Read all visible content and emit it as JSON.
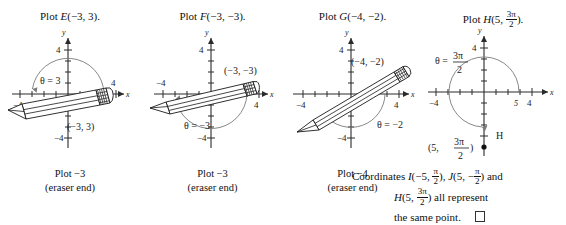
{
  "figure": {
    "panels": [
      {
        "id": "plot-e",
        "title_prefix": "Plot ",
        "title_letter": "E",
        "title_args": "(−3, 3).",
        "theta_label": "θ = 3",
        "point_label": "(−3, 3)",
        "caption_line1": "Plot −3",
        "caption_line2": "(eraser end)",
        "x_tick_labels": [
          "−4",
          "4"
        ],
        "y_tick_labels": [
          "4",
          "−4"
        ],
        "x_axis_name": "x",
        "y_axis_name": "y",
        "r": -3,
        "theta": 3
      },
      {
        "id": "plot-f",
        "title_prefix": "Plot ",
        "title_letter": "F",
        "title_args": "(−3, −3).",
        "theta_label": "θ = −3",
        "point_label": "(−3, −3)",
        "caption_line1": "Plot −3",
        "caption_line2": "(eraser end)",
        "x_tick_labels": [
          "−4",
          "4"
        ],
        "y_tick_labels": [
          "4",
          "−4"
        ],
        "x_axis_name": "x",
        "y_axis_name": "y",
        "r": -3,
        "theta": -3
      },
      {
        "id": "plot-g",
        "title_prefix": "Plot ",
        "title_letter": "G",
        "title_args": "(−4, −2).",
        "theta_label": "θ = −2",
        "point_label": "(−4, −2)",
        "caption_line1": "Plot −4",
        "caption_line2": "(eraser end)",
        "x_tick_labels": [
          "−4",
          "4"
        ],
        "y_tick_labels": [
          "4",
          "−4"
        ],
        "x_axis_name": "x",
        "y_axis_name": "y",
        "r": -4,
        "theta": -2
      },
      {
        "id": "plot-h",
        "title_prefix": "Plot ",
        "title_letter": "H",
        "title_args_pre": "(5, ",
        "title_frac_num": "3π",
        "title_frac_den": "2",
        "title_args_post": ").",
        "theta_eq": "θ = ",
        "theta_frac_num": "3π",
        "theta_frac_den": "2",
        "point_pre": "(5, ",
        "point_frac_num": "3π",
        "point_frac_den": "2",
        "point_post": ")",
        "point_letter": "H",
        "x_tick_labels": [
          "−4",
          "4"
        ],
        "y_tick_labels": [
          "4"
        ],
        "x_tick_italic": "5",
        "x_axis_name": "x",
        "y_axis_name": "y",
        "r": 5,
        "theta": 4.712388
      }
    ],
    "note": {
      "line1_pre": "Coordinates ",
      "line1_i": "I",
      "line1_i_args_pre": "(−5, ",
      "line1_i_frac_num": "π",
      "line1_i_frac_den": "2",
      "line1_i_args_post": "), ",
      "line1_j": "J",
      "line1_j_args_pre": "(5, −",
      "line1_j_frac_num": "π",
      "line1_j_frac_den": "2",
      "line1_j_args_post": ") and",
      "line2_h": "H",
      "line2_pre": "(5, ",
      "line2_frac_num": "3π",
      "line2_frac_den": "2",
      "line2_post": ") all represent",
      "line3": "the same point."
    }
  }
}
